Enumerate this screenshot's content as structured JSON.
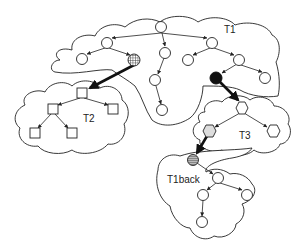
{
  "labels": {
    "t1": "T1",
    "t2": "T2",
    "t3": "T3",
    "t1back": "T1back"
  },
  "colors": {
    "stroke": "#222222",
    "hatched_fill": "#888888",
    "black_node": "#111111",
    "gray_hex": "#dddddd",
    "background": "#ffffff"
  },
  "trees": [
    {
      "name": "T1",
      "shape": "circle",
      "node_count": 12
    },
    {
      "name": "T2",
      "shape": "square",
      "node_count": 5
    },
    {
      "name": "T3",
      "shape": "hexagon",
      "node_count": 3
    },
    {
      "name": "T1back",
      "shape": "circle",
      "node_count": 5
    }
  ]
}
